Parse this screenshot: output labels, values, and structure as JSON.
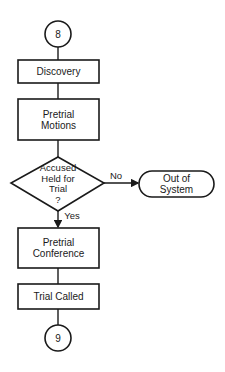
{
  "diagram": {
    "type": "flowchart",
    "nodes": {
      "start_connector": {
        "label": "8",
        "shape": "circle"
      },
      "discovery": {
        "label": "Discovery",
        "shape": "process"
      },
      "pretrial_motions": {
        "line1": "Pretrial",
        "line2": "Motions",
        "shape": "process"
      },
      "decision": {
        "line1": "Accused",
        "line2": "Held for",
        "line3": "Trial",
        "line4": "?",
        "shape": "decision"
      },
      "out_of_system": {
        "line1": "Out of",
        "line2": "System",
        "shape": "terminal"
      },
      "pretrial_conference": {
        "line1": "Pretrial",
        "line2": "Conference",
        "shape": "process"
      },
      "trial_called": {
        "label": "Trial Called",
        "shape": "process"
      },
      "end_connector": {
        "label": "9",
        "shape": "circle"
      }
    },
    "edges": {
      "no_label": "No",
      "yes_label": "Yes"
    },
    "colors": {
      "stroke": "#1a1a1a",
      "background": "#ffffff"
    }
  }
}
